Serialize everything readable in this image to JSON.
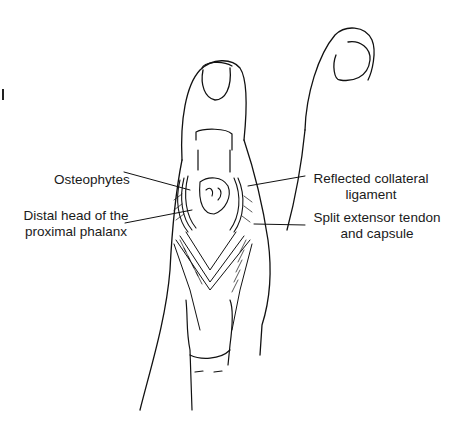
{
  "figure": {
    "type": "surgical illustration",
    "line_color": "#111111",
    "background": "#ffffff"
  },
  "labels": {
    "osteophytes": "Osteophytes",
    "distal_head_line1": "Distal head of the",
    "distal_head_line2": "proximal phalanx",
    "reflected_line1": "Reflected collateral",
    "reflected_line2": "ligament",
    "split_line1": "Split extensor tendon",
    "split_line2": "and capsule"
  }
}
